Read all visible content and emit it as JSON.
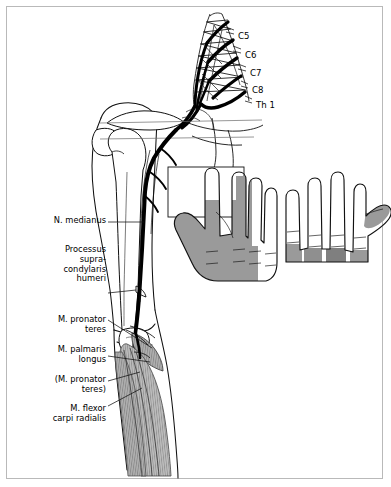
{
  "figure": {
    "title": "N. medianus",
    "background_color": "#ffffff",
    "border_color": "#b9b9b9",
    "ink_color": "#000000",
    "shade_color": "#9a9a9a",
    "muscle_shade_color": "#a8a8a8"
  },
  "root_labels": [
    {
      "text": "C5",
      "x": 238,
      "y": 31
    },
    {
      "text": "C6",
      "x": 245,
      "y": 50
    },
    {
      "text": "C7",
      "x": 250,
      "y": 68
    },
    {
      "text": "C8",
      "x": 252,
      "y": 85
    },
    {
      "text": "Th 1",
      "x": 256,
      "y": 100
    }
  ],
  "structure_labels": [
    {
      "name": "n-medianus",
      "lines": [
        "N. medianus"
      ],
      "x": 14,
      "y": 216,
      "width": 92
    },
    {
      "name": "processus-supracondylaris-humeri",
      "lines": [
        "Processus",
        "supra-",
        "condylaris",
        "humeri"
      ],
      "x": 14,
      "y": 245,
      "width": 92
    },
    {
      "name": "m-pronator-teres",
      "lines": [
        "M. pronator",
        "teres"
      ],
      "x": 14,
      "y": 315,
      "width": 92
    },
    {
      "name": "m-palmaris-longus",
      "lines": [
        "M. palmaris",
        "longus"
      ],
      "x": 14,
      "y": 345,
      "width": 92
    },
    {
      "name": "m-pronator-teres-parenthetical",
      "lines": [
        "(M. pronator",
        "teres)"
      ],
      "x": 10,
      "y": 375,
      "width": 96
    },
    {
      "name": "m-flexor-carpi-radialis",
      "lines": [
        "M. flexor",
        "carpi radialis"
      ],
      "x": 10,
      "y": 404,
      "width": 96
    }
  ],
  "hands": [
    {
      "name": "palmar-hand",
      "view": "palmar",
      "shaded_region": "median-nerve-sensory-territory-palmar"
    },
    {
      "name": "dorsal-hand",
      "view": "dorsal",
      "shaded_region": "median-nerve-sensory-territory-dorsal-fingertips"
    }
  ]
}
